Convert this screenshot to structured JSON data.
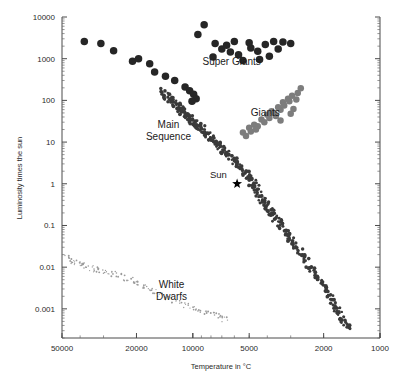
{
  "chart_data": {
    "type": "scatter",
    "title": "",
    "xlabel": "Temperature in °C",
    "ylabel": "Luminosity times the sun",
    "x_scale": "log",
    "y_scale": "log",
    "x_reversed": true,
    "xlim": [
      50000,
      1000
    ],
    "ylim": [
      10000,
      0.0002
    ],
    "grid": false,
    "legend": "none",
    "xticks": [
      50000,
      20000,
      10000,
      5000,
      2000,
      1000
    ],
    "xtick_labels": [
      "50000",
      "20000",
      "10000",
      "5000",
      "2000",
      "1000"
    ],
    "yticks": [
      10000,
      1000,
      100,
      10,
      1,
      0.1,
      0.01,
      0.001
    ],
    "ytick_labels": [
      "10000",
      "1000",
      "100",
      "10",
      "1",
      "0.1",
      "0.01",
      "0.001"
    ],
    "annotations": [
      {
        "name": "super-giants",
        "text": "Super Giants",
        "x": 6200,
        "y": 700
      },
      {
        "name": "giants",
        "text": "Giants",
        "x": 4100,
        "y": 42
      },
      {
        "name": "main-sequence",
        "text": "Main\nSequence",
        "x": 13500,
        "y": 22
      },
      {
        "name": "white-dwarfs",
        "text": "White\nDwarfs",
        "x": 13000,
        "y": 0.0032
      },
      {
        "name": "sun",
        "text": "Sun",
        "x": 7300,
        "y": 1.4
      }
    ],
    "sun_marker": {
      "x": 5800,
      "y": 1.0,
      "symbol": "star"
    },
    "series": [
      {
        "name": "Super Giants",
        "marker": "circle",
        "color": "#262626",
        "size": 7.5,
        "points": [
          [
            38000,
            2600
          ],
          [
            31000,
            2300
          ],
          [
            26500,
            1550
          ],
          [
            21000,
            870
          ],
          [
            19500,
            1000
          ],
          [
            17000,
            760
          ],
          [
            16000,
            480
          ],
          [
            14000,
            380
          ],
          [
            12500,
            300
          ],
          [
            11000,
            210
          ],
          [
            10400,
            170
          ],
          [
            9900,
            140
          ],
          [
            9600,
            110
          ],
          [
            10100,
            95
          ],
          [
            9400,
            3800
          ],
          [
            8700,
            6500
          ],
          [
            7600,
            2300
          ],
          [
            7000,
            1700
          ],
          [
            6600,
            2100
          ],
          [
            6300,
            1450
          ],
          [
            5700,
            1250
          ],
          [
            5400,
            900
          ],
          [
            4900,
            1800
          ],
          [
            4500,
            1500
          ],
          [
            4100,
            2200
          ],
          [
            3700,
            2600
          ],
          [
            3500,
            1700
          ],
          [
            3300,
            2500
          ],
          [
            3000,
            2300
          ],
          [
            6000,
            2600
          ],
          [
            5000,
            2400
          ],
          [
            4400,
            950
          ],
          [
            3900,
            1150
          ],
          [
            7800,
            1100
          ]
        ]
      },
      {
        "name": "Giants",
        "marker": "circle",
        "color": "#7d7d7d",
        "size": 6.5,
        "points": [
          [
            5400,
            17
          ],
          [
            5200,
            14
          ],
          [
            5000,
            22
          ],
          [
            4900,
            18
          ],
          [
            4700,
            26
          ],
          [
            4500,
            24
          ],
          [
            4300,
            35
          ],
          [
            4150,
            30
          ],
          [
            4000,
            45
          ],
          [
            3900,
            38
          ],
          [
            3800,
            55
          ],
          [
            3700,
            50
          ],
          [
            3600,
            42
          ],
          [
            3500,
            68
          ],
          [
            3400,
            60
          ],
          [
            3300,
            90
          ],
          [
            3250,
            75
          ],
          [
            3100,
            110
          ],
          [
            3050,
            95
          ],
          [
            2950,
            130
          ],
          [
            2900,
            62
          ],
          [
            2800,
            105
          ],
          [
            2750,
            150
          ],
          [
            2650,
            195
          ],
          [
            3400,
            33
          ],
          [
            4600,
            20
          ],
          [
            3000,
            48
          ]
        ]
      },
      {
        "name": "Main Sequence",
        "marker": "circle",
        "color": "#3a3a3a",
        "size": 3.2,
        "points": [
          [
            14500,
            165
          ],
          [
            14000,
            140
          ],
          [
            13600,
            120
          ],
          [
            13200,
            105
          ],
          [
            12900,
            95
          ],
          [
            12600,
            88
          ],
          [
            12300,
            80
          ],
          [
            12000,
            72
          ],
          [
            11800,
            66
          ],
          [
            11600,
            60
          ],
          [
            11400,
            55
          ],
          [
            11200,
            50
          ],
          [
            11000,
            46
          ],
          [
            10800,
            43
          ],
          [
            10600,
            40
          ],
          [
            10400,
            37
          ],
          [
            10200,
            34
          ],
          [
            10000,
            31
          ],
          [
            9800,
            29
          ],
          [
            9600,
            27
          ],
          [
            9400,
            25
          ],
          [
            9200,
            23
          ],
          [
            9000,
            21
          ],
          [
            8800,
            19
          ],
          [
            8600,
            17
          ],
          [
            8400,
            15.5
          ],
          [
            8200,
            14
          ],
          [
            8000,
            12.5
          ],
          [
            7800,
            11
          ],
          [
            7600,
            10
          ],
          [
            7400,
            9
          ],
          [
            7200,
            8
          ],
          [
            7000,
            7
          ],
          [
            6800,
            6.2
          ],
          [
            6600,
            5.4
          ],
          [
            6400,
            4.7
          ],
          [
            6200,
            4.1
          ],
          [
            6000,
            3.5
          ],
          [
            5800,
            3.0
          ],
          [
            5600,
            2.5
          ],
          [
            5400,
            2.1
          ],
          [
            5200,
            1.75
          ],
          [
            5000,
            1.45
          ],
          [
            4900,
            1.25
          ],
          [
            4800,
            1.05
          ],
          [
            4700,
            0.9
          ],
          [
            4600,
            0.78
          ],
          [
            4500,
            0.66
          ],
          [
            4400,
            0.56
          ],
          [
            4300,
            0.47
          ],
          [
            4200,
            0.4
          ],
          [
            4100,
            0.34
          ],
          [
            4000,
            0.29
          ],
          [
            3900,
            0.24
          ],
          [
            3800,
            0.2
          ],
          [
            3700,
            0.17
          ],
          [
            3600,
            0.14
          ],
          [
            3500,
            0.12
          ],
          [
            3400,
            0.1
          ],
          [
            3300,
            0.082
          ],
          [
            3200,
            0.067
          ],
          [
            3100,
            0.055
          ],
          [
            3000,
            0.045
          ],
          [
            2900,
            0.036
          ],
          [
            2800,
            0.029
          ],
          [
            2700,
            0.023
          ],
          [
            2600,
            0.018
          ],
          [
            2500,
            0.014
          ],
          [
            2400,
            0.011
          ],
          [
            2300,
            0.0085
          ],
          [
            2200,
            0.0065
          ],
          [
            2100,
            0.005
          ],
          [
            2000,
            0.0038
          ],
          [
            1950,
            0.003
          ],
          [
            1900,
            0.0024
          ],
          [
            1850,
            0.0019
          ],
          [
            1800,
            0.0015
          ],
          [
            1750,
            0.0012
          ],
          [
            1700,
            0.00095
          ],
          [
            1650,
            0.00075
          ],
          [
            1600,
            0.00058
          ],
          [
            1550,
            0.00046
          ],
          [
            1500,
            0.00037
          ]
        ]
      },
      {
        "name": "White Dwarfs",
        "marker": "circle",
        "color": "#9a9a9a",
        "size": 1.6,
        "points": [
          [
            47000,
            0.018
          ],
          [
            45000,
            0.014
          ],
          [
            43000,
            0.012
          ],
          [
            41000,
            0.0125
          ],
          [
            39000,
            0.011
          ],
          [
            37000,
            0.0105
          ],
          [
            35000,
            0.0095
          ],
          [
            33000,
            0.0088
          ],
          [
            31000,
            0.0082
          ],
          [
            29000,
            0.0075
          ],
          [
            27000,
            0.0068
          ],
          [
            25000,
            0.0062
          ],
          [
            23000,
            0.0055
          ],
          [
            21000,
            0.0048
          ],
          [
            19500,
            0.0042
          ],
          [
            18000,
            0.0036
          ],
          [
            17000,
            0.0031
          ],
          [
            16000,
            0.0027
          ],
          [
            15000,
            0.0023
          ],
          [
            14000,
            0.0019
          ],
          [
            13000,
            0.0016
          ],
          [
            12000,
            0.0014
          ],
          [
            11000,
            0.0012
          ],
          [
            10000,
            0.00105
          ],
          [
            9200,
            0.00092
          ],
          [
            8500,
            0.00082
          ],
          [
            7800,
            0.00073
          ],
          [
            7200,
            0.00065
          ],
          [
            6700,
            0.00058
          ]
        ]
      }
    ]
  },
  "axes": {
    "x_title": "Temperature in °C",
    "y_title": "Luminosity times the sun"
  }
}
